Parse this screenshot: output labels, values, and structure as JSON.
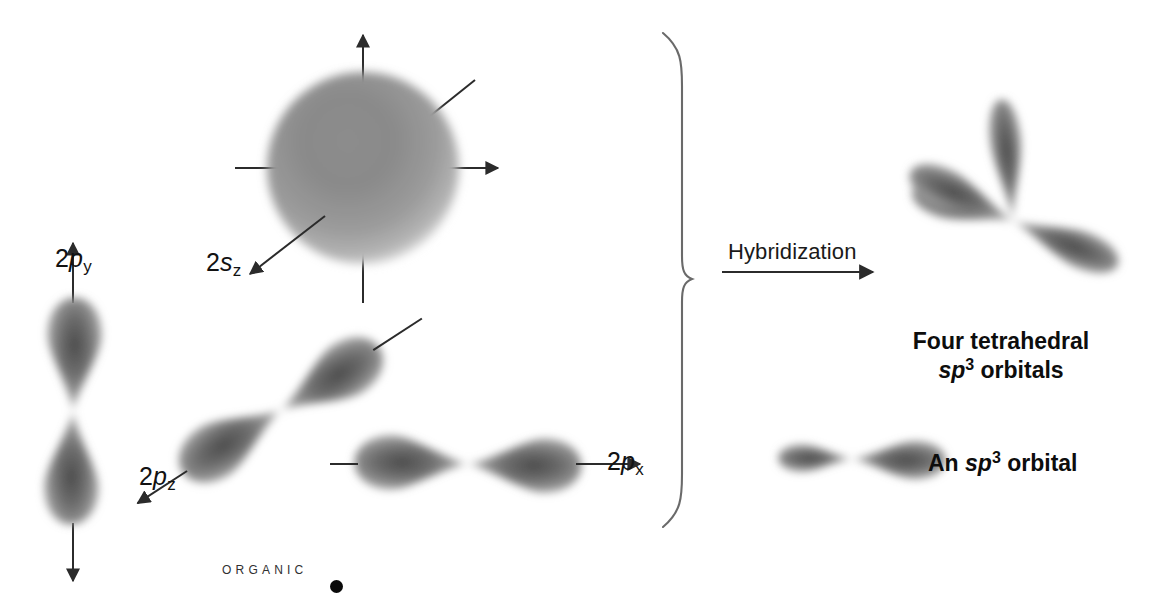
{
  "figure": {
    "background_color": "#ffffff",
    "ink_color": "#1a1a1a"
  },
  "left_group": {
    "caption": "Atomic orbitals of carbon",
    "orbitals": [
      {
        "id": "2py",
        "label_main": "2",
        "label_italic": "p",
        "label_sub": "y",
        "shape": "vertical dumbbell",
        "axis": "vertical with arrowheads up and down"
      },
      {
        "id": "2s",
        "label_main": "2",
        "label_italic": "s",
        "label_sub": "z",
        "shape": "sphere",
        "axis": "four axis lines through sphere"
      },
      {
        "id": "2pz",
        "label_main": "2",
        "label_italic": "p",
        "label_sub": "z",
        "shape": "diagonal dumbbell",
        "axis": "diagonal with arrowhead lower-left"
      },
      {
        "id": "2px",
        "label_main": "2",
        "label_italic": "p",
        "label_sub": "x",
        "shape": "horizontal dumbbell",
        "axis": "horizontal with arrowhead right"
      }
    ]
  },
  "transform": {
    "arrow_label": "Hybridization",
    "arrow_direction": "right",
    "brace": "right-facing curly brace"
  },
  "right_group": {
    "tetrahedral": {
      "line1": "Four tetrahedral",
      "italic": "sp",
      "superscript": "3",
      "line2_tail": " orbitals",
      "lobe_count": 4
    },
    "single": {
      "prefix": "An ",
      "italic": "sp",
      "superscript": "3",
      "suffix": " orbital",
      "shape": "asymmetric lobe, small left / large right"
    }
  },
  "footer": {
    "brand": "ORGANIC",
    "bullet": "•"
  }
}
